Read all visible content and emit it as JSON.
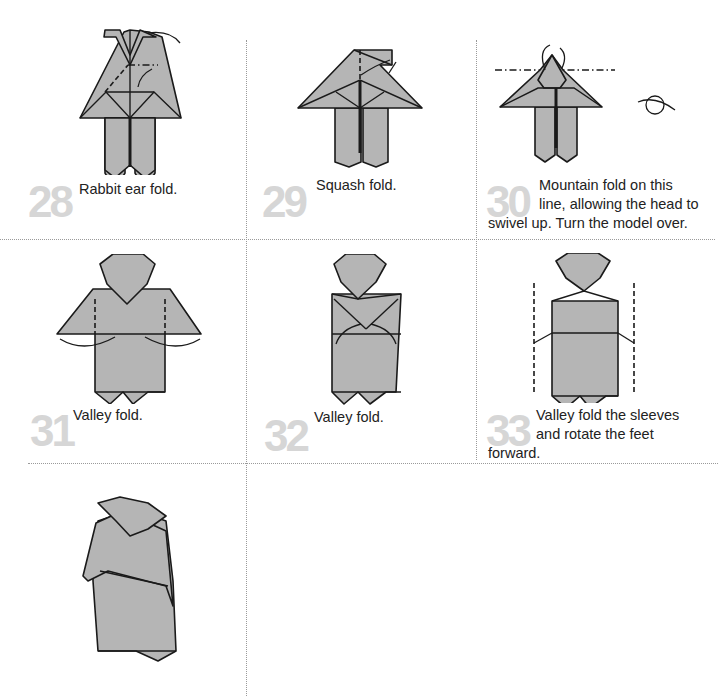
{
  "page": {
    "background": "#ffffff",
    "paper_color": "#b5b5b5",
    "step_number_color": "#d6d6d6",
    "grid_line_color": "#9a9a9a"
  },
  "steps": [
    {
      "number": "28",
      "caption": "Rabbit ear fold."
    },
    {
      "number": "29",
      "caption": "Squash fold."
    },
    {
      "number": "30",
      "caption_line1": "Mountain fold on this",
      "caption_line2": "line, allowing the head to",
      "caption_line3": "swivel up. Turn the model over."
    },
    {
      "number": "31",
      "caption": "Valley fold."
    },
    {
      "number": "32",
      "caption": "Valley fold."
    },
    {
      "number": "33",
      "caption_line1": "Valley fold the sleeves",
      "caption_line2": "and rotate the feet",
      "caption_line3": "forward."
    },
    {
      "number": "",
      "caption": ""
    }
  ]
}
